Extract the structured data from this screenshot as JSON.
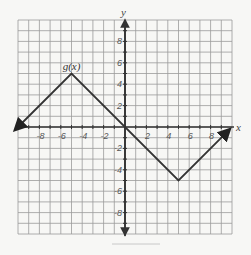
{
  "chart_data": {
    "type": "line",
    "title": "",
    "xlabel": "x",
    "ylabel": "y",
    "xlim": [
      -10,
      10
    ],
    "ylim": [
      -10,
      10
    ],
    "grid": true,
    "grid_step": 1,
    "x_ticks": [
      -8,
      -6,
      -4,
      -2,
      2,
      4,
      6,
      8
    ],
    "y_ticks": [
      8,
      6,
      4,
      2,
      -2,
      -4,
      -6,
      -8
    ],
    "x_tick_labels": [
      "-8",
      "-6",
      "-4",
      "-2",
      "2",
      "4",
      "6",
      "8"
    ],
    "y_tick_labels": [
      "8",
      "6",
      "4",
      "2",
      "-2",
      "-4",
      "-6",
      "-8"
    ],
    "series": [
      {
        "name": "g(x)",
        "label_position": [
          -5,
          5
        ],
        "points": [
          [
            -10,
            0
          ],
          [
            -5,
            5
          ],
          [
            5,
            -5
          ],
          [
            9.5,
            -0.5
          ]
        ],
        "arrows": [
          "start",
          "end"
        ],
        "color": "#333333"
      }
    ],
    "legend": "inline label near peak"
  },
  "colors": {
    "background": "#f7f7f5",
    "grid": "#9a9a9a",
    "axis": "#333333",
    "curve": "#333333"
  }
}
